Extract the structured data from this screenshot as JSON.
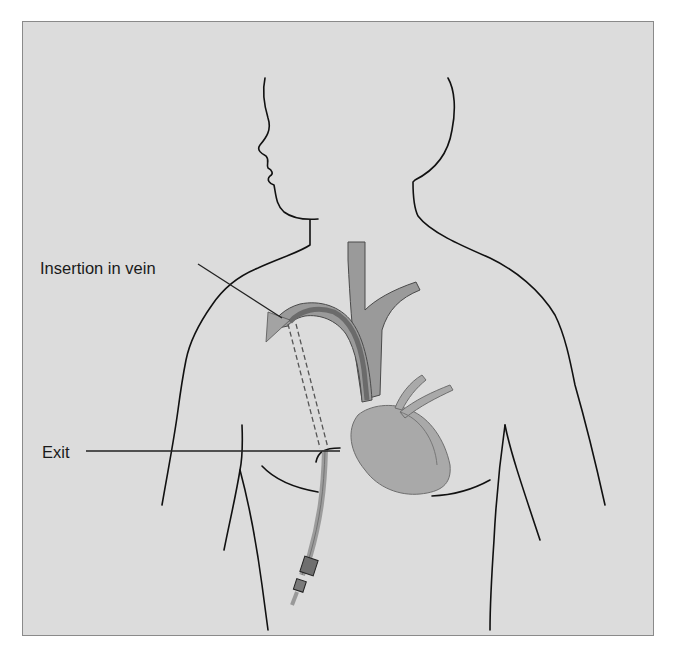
{
  "figure": {
    "labels": {
      "insertion": "Insertion in vein",
      "exit": "Exit"
    },
    "colors": {
      "background": "#dcdcdc",
      "frame_border": "#8a8a8a",
      "outline": "#111111",
      "vessel": "#9a9a9a",
      "vessel_edge": "#4a4a4a",
      "catheter_in_vein": "#6b6b6b",
      "heart": "#a9a9a9",
      "heart_edge": "#6e6e6e",
      "catheter_external": "#9c9c9c",
      "connector": "#6f6f6f"
    },
    "parts": [
      "body-outline",
      "face-profile",
      "superior-vena-cava",
      "brachiocephalic-veins",
      "heart",
      "tunneled-catheter",
      "catheter-hub"
    ]
  }
}
